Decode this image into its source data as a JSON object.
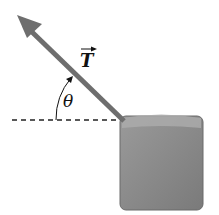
{
  "diagram": {
    "vector_label": "T",
    "angle_label": "θ",
    "colors": {
      "arrow": "#6e6e6e",
      "block": "#8f8f8f",
      "block_top": "#a9a9a9",
      "line": "#222222"
    }
  }
}
